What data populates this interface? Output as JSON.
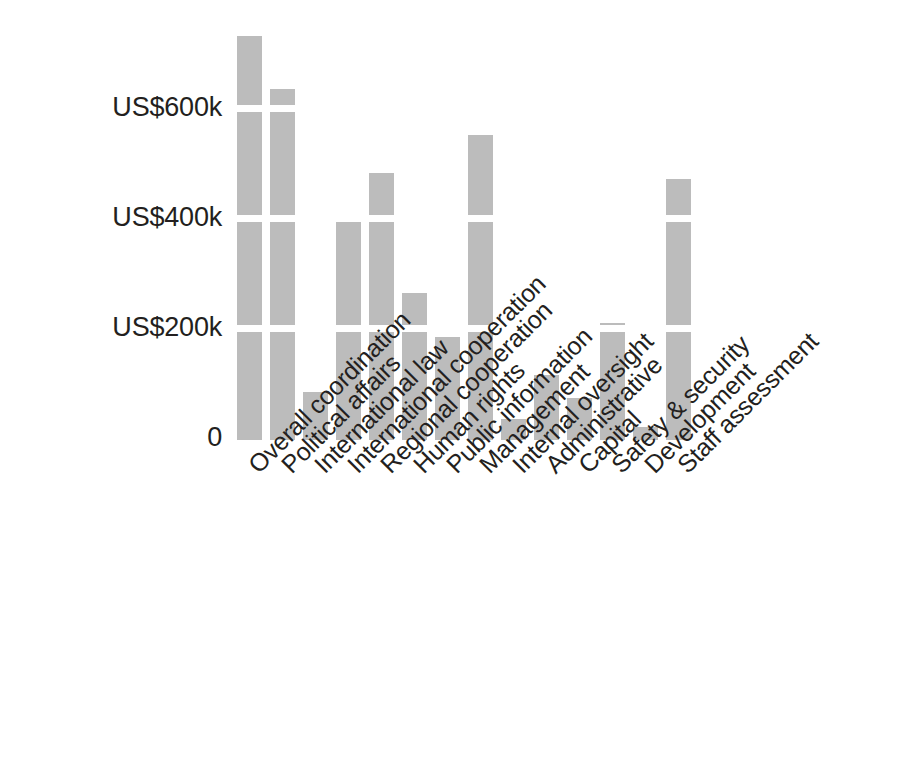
{
  "chart_data": {
    "type": "bar",
    "title": "",
    "subtitle": "",
    "xlabel": "",
    "ylabel": "",
    "categories": [
      "Overall coordination",
      "Political affairs",
      "International law",
      "International cooperation",
      "Regional cooperation",
      "Human rights",
      "Public information",
      "Management",
      "Internal oversight",
      "Administrative",
      "Capital",
      "Safety & security",
      "Development",
      "Staff assessment"
    ],
    "values": [
      735,
      638,
      87,
      405,
      485,
      267,
      187,
      555,
      38,
      118,
      76,
      213,
      24,
      475
    ],
    "value_unit": "US$ thousands",
    "ylim": [
      0,
      760
    ],
    "yticks": [
      0,
      200000,
      400000,
      600000
    ],
    "ytick_labels": [
      "0",
      "US$200k",
      "US$400k",
      "US$600k"
    ],
    "grid": "horizontal-white-over-bars",
    "legend": "none",
    "bar_color": "#bcbcbc",
    "text_color": "#231f20",
    "background_color": "#ffffff"
  },
  "axis": {
    "y_ticks": [
      {
        "label": "US$600k",
        "value": 600
      },
      {
        "label": "US$400k",
        "value": 400
      },
      {
        "label": "US$200k",
        "value": 200
      },
      {
        "label": "0",
        "value": 0
      }
    ]
  },
  "bars": [
    {
      "label": "Overall coordination",
      "value": 735
    },
    {
      "label": "Political affairs",
      "value": 638
    },
    {
      "label": "International law",
      "value": 87
    },
    {
      "label": "International cooperation",
      "value": 405
    },
    {
      "label": "Regional cooperation",
      "value": 485
    },
    {
      "label": "Human rights",
      "value": 267
    },
    {
      "label": "Public information",
      "value": 187
    },
    {
      "label": "Management",
      "value": 555
    },
    {
      "label": "Internal oversight",
      "value": 38
    },
    {
      "label": "Administrative",
      "value": 118
    },
    {
      "label": "Capital",
      "value": 76
    },
    {
      "label": "Safety & security",
      "value": 213
    },
    {
      "label": "Development",
      "value": 24
    },
    {
      "label": "Staff assessment",
      "value": 475
    }
  ]
}
